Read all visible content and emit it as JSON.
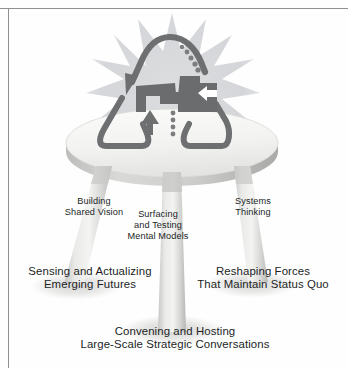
{
  "figure": {
    "frame_color": "#8f9093",
    "background_color": "#ffffff"
  },
  "emblem": {
    "name": "recycling-loop-with-puzzle-pieces",
    "starburst_color": "#d9dadc",
    "loop_color": "#6e6f71",
    "puzzle_color": "#6b6c6e",
    "arrow_white_color": "#ffffff",
    "parts": [
      "solid-descending-arrow",
      "dotted-descending-arrow",
      "upward-arrow",
      "left-pointing-white-arrow",
      "interlocking-puzzle-pieces"
    ]
  },
  "stool": {
    "seat_color": "#f2f2f1",
    "seat_edge_color": "#c9cac9",
    "leg_color": "#dedfdd",
    "leg_shadow_color": "#b9bab8",
    "shadow_color": "#e2e3e2",
    "legs": [
      {
        "id": "left",
        "label": "Building\nShared Vision"
      },
      {
        "id": "center",
        "label": "Surfacing\nand Testing\nMental Models"
      },
      {
        "id": "right",
        "label": "Systems\nThinking"
      }
    ]
  },
  "labels": {
    "leg_left": {
      "line1": "Building",
      "line2": "Shared Vision"
    },
    "leg_center": {
      "line1": "Surfacing",
      "line2": "and Testing",
      "line3": "Mental Models"
    },
    "leg_right": {
      "line1": "Systems",
      "line2": "Thinking"
    },
    "base_left": {
      "line1": "Sensing and Actualizing",
      "line2": "Emerging Futures"
    },
    "base_right": {
      "line1": "Reshaping Forces",
      "line2": "That Maintain Status Quo"
    },
    "base_center": {
      "line1": "Convening and Hosting",
      "line2": "Large-Scale Strategic Conversations"
    }
  }
}
